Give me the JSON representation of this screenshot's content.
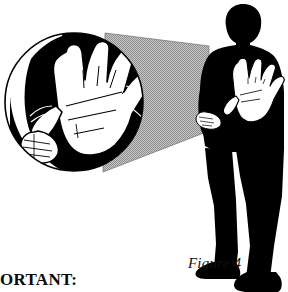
{
  "page": {
    "width": 288,
    "height": 292,
    "background_color": "#ffffff"
  },
  "figure": {
    "caption": "Figure 4",
    "note_text": "IMPORTANT:",
    "note_clipped": true
  },
  "colors": {
    "ink": "#000000",
    "paper": "#ffffff",
    "halftone_gray": "#b4b4b4",
    "halftone_dot": "#8c8c8c",
    "skin_fill": "#ffffff",
    "line": "#000000"
  },
  "elements": {
    "magnifier_label": "magnified detail circle",
    "cone_label": "magnifier connector cone",
    "person_label": "person silhouette",
    "raised_hand_label": "raised open palm",
    "lower_hand_label": "lower hand"
  },
  "geometry": {
    "circle": {
      "cx": 74,
      "cy": 102,
      "r": 70
    },
    "cone": {
      "left_x": 105,
      "right_x": 209,
      "top_y": 33,
      "bottom_y": 172
    },
    "person": {
      "left_x": 196,
      "right_x": 284,
      "top_y": 4,
      "bottom_y": 292
    }
  }
}
